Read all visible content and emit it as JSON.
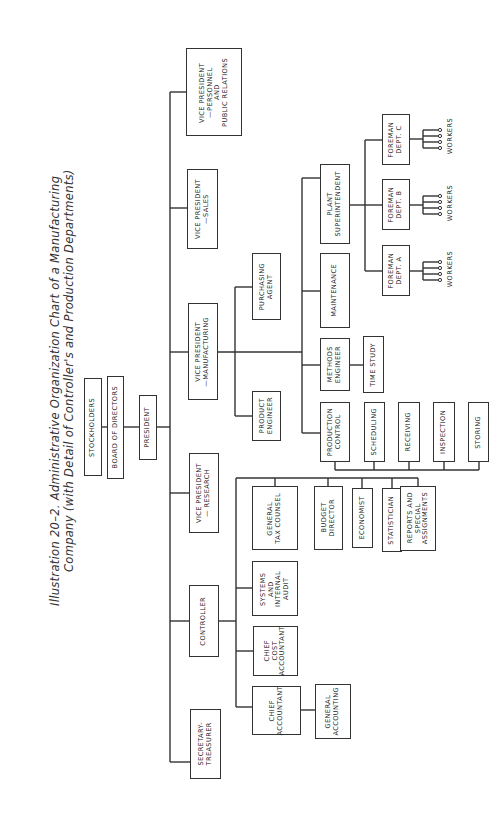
{
  "title": {
    "line1": "Illustration  20–2.  Administrative  Organization  Chart  of  a  Manufacturing",
    "line2": "Company  (with  Detail  of  Controller's  and  Production  Departments)"
  },
  "nodes": {
    "stockholders": "STOCKHOLDERS",
    "board": "BOARD OF DIRECTORS",
    "president": "PRESIDENT",
    "secretary_treasurer": "SECRETARY-\nTREASURER",
    "controller": "CONTROLLER",
    "vp_research": "VICE PRESIDENT\n— RESEARCH",
    "vp_manufacturing": "VICE PRESIDENT\n—MANUFACTURING",
    "vp_sales": "VICE PRESIDENT\n—SALES",
    "vp_personnel": "VICE PRESIDENT\n—PERSONNEL\nAND\nPUBLIC RELATIONS",
    "chief_accountant": "CHIEF\nACCOUNTANT",
    "general_accounting": "GENERAL\nACCOUNTING",
    "chief_cost_accountant": "CHIEF\nCOST\nACCOUNTANT",
    "systems_audit": "SYSTEMS\nAND\nINTERNAL\nAUDIT",
    "general_tax_counsel": "GENERAL\nTAX COUNSEL",
    "budget_director": "BUDGET\nDIRECTOR",
    "economist": "ECONOMIST",
    "statistician": "STATISTICIAN",
    "reports": "REPORTS AND\nSPECIAL\nASSIGNMENTS",
    "product_engineer": "PRODUCT\nENGINEER",
    "purchasing_agent": "PURCHASING\nAGENT",
    "production_control": "PRODUCTION\nCONTROL",
    "scheduling": "SCHEDULING",
    "receiving": "RECEIVING",
    "inspection": "INSPECTION",
    "storing": "STORING",
    "methods_engineer": "METHODS\nENGINEER",
    "time_study": "TIME STUDY",
    "maintenance": "MAINTENANCE",
    "plant_superintendent": "PLANT\nSUPERINTENDENT",
    "foreman_a": "FOREMAN\nDEPT. A",
    "foreman_b": "FOREMAN\nDEPT. B",
    "foreman_c": "FOREMAN\nDEPT. C"
  },
  "workers": {
    "a": "WORKERS",
    "b": "WORKERS",
    "c": "WORKERS"
  }
}
